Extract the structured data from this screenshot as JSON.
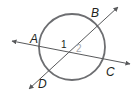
{
  "diagram": {
    "type": "circle-with-intersecting-secants",
    "points": {
      "A": "A",
      "B": "B",
      "C": "C",
      "D": "D"
    },
    "angles": {
      "angle1": "1",
      "angle2": "2"
    },
    "colors": {
      "circle": "#6d6e71",
      "lines": "#58595b",
      "text": "#231f20",
      "angle2": "#a7a9ac"
    }
  }
}
